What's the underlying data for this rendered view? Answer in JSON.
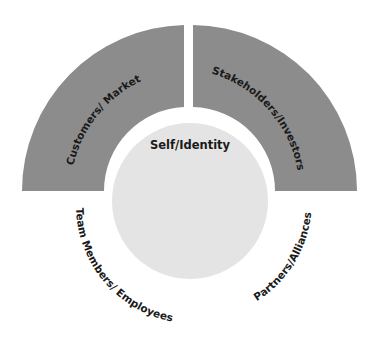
{
  "diagram": {
    "center": {
      "label": "Self/Identity",
      "fill": "#e4e4e4"
    },
    "upper_segments": [
      {
        "label": "Customers/ Market",
        "fill": "#8c8c8c"
      },
      {
        "label": "Stakeholders/Investors",
        "fill": "#8c8c8c"
      }
    ],
    "lower_labels": [
      {
        "label": "Team Members/ Employees"
      },
      {
        "label": "Partners/Alliances"
      }
    ],
    "text_color": "#1a1a1a",
    "background": "#ffffff"
  }
}
